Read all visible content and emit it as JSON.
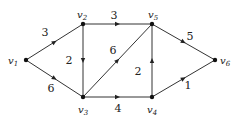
{
  "graph": {
    "directed": true,
    "nodes": [
      {
        "id": "v1",
        "label": "v",
        "sub": "1",
        "x": 26,
        "y": 60,
        "lx": 8,
        "ly": 64
      },
      {
        "id": "v2",
        "label": "v",
        "sub": "2",
        "x": 83,
        "y": 24,
        "lx": 77,
        "ly": 18
      },
      {
        "id": "v3",
        "label": "v",
        "sub": "3",
        "x": 83,
        "y": 97,
        "lx": 78,
        "ly": 113
      },
      {
        "id": "v4",
        "label": "v",
        "sub": "4",
        "x": 152,
        "y": 97,
        "lx": 147,
        "ly": 113
      },
      {
        "id": "v5",
        "label": "v",
        "sub": "5",
        "x": 152,
        "y": 24,
        "lx": 148,
        "ly": 18
      },
      {
        "id": "v6",
        "label": "v",
        "sub": "6",
        "x": 215,
        "y": 60,
        "lx": 220,
        "ly": 64
      }
    ],
    "edges": [
      {
        "from": "v1",
        "to": "v2",
        "weight": "3",
        "wx": 45,
        "wy": 36
      },
      {
        "from": "v1",
        "to": "v3",
        "weight": "6",
        "wx": 51,
        "wy": 92
      },
      {
        "from": "v2",
        "to": "v5",
        "weight": "3",
        "wx": 114,
        "wy": 19
      },
      {
        "from": "v2",
        "to": "v3",
        "weight": "2",
        "wx": 69,
        "wy": 64
      },
      {
        "from": "v3",
        "to": "v5",
        "weight": "6",
        "wx": 113,
        "wy": 54
      },
      {
        "from": "v3",
        "to": "v4",
        "weight": "4",
        "wx": 118,
        "wy": 112
      },
      {
        "from": "v4",
        "to": "v5",
        "weight": "2",
        "wx": 138,
        "wy": 75
      },
      {
        "from": "v4",
        "to": "v6",
        "weight": "1",
        "wx": 188,
        "wy": 89
      },
      {
        "from": "v5",
        "to": "v6",
        "weight": "5",
        "wx": 190,
        "wy": 40
      }
    ]
  }
}
